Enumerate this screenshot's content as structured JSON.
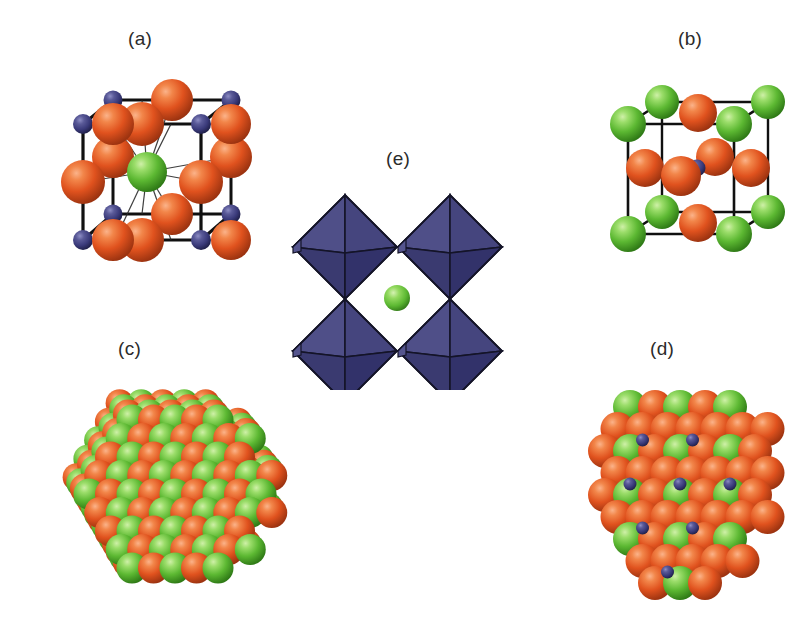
{
  "figure": {
    "background_color": "#ffffff",
    "width": 795,
    "height": 626,
    "caption_font_size": 19,
    "caption_color": "#2b2b2b"
  },
  "palette": {
    "orange_atom": "#E0521E",
    "orange_atom_light": "#F2864A",
    "orange_atom_dark": "#A63512",
    "green_atom": "#5CB832",
    "green_atom_light": "#9BDD6A",
    "green_atom_dark": "#3B8C1C",
    "blue_atom": "#3A3A7A",
    "blue_atom_light": "#6E6EA8",
    "blue_atom_dark": "#22224D",
    "octahedron_face_light": "#4F4F88",
    "octahedron_face_mid": "#43437A",
    "octahedron_face_dark": "#34346A",
    "octahedron_edge": "#141428",
    "cell_edge": "#101010",
    "bond_thin": "#2a2a2a"
  },
  "panels": [
    {
      "id": "a",
      "label": "(a)",
      "label_x": 128,
      "label_y": 28,
      "description": "cubic unit cell with corner small blue atoms, edge-midpoint orange atoms and a central green atom bonded to twelve orange neighbours",
      "structure_type": "unit-cell",
      "atom_counts": {
        "orange": 12,
        "blue": 8,
        "green": 1
      },
      "bonds_from_center": 12
    },
    {
      "id": "b",
      "label": "(b)",
      "label_x": 678,
      "label_y": 28,
      "description": "cubic unit cell with corner green atoms, face-centred orange atoms and one small blue atom at the body centre",
      "structure_type": "unit-cell",
      "atom_counts": {
        "green": 8,
        "orange": 6,
        "blue": 1
      }
    },
    {
      "id": "c",
      "label": "(c)",
      "label_x": 118,
      "label_y": 338,
      "description": "large close-packed cluster of green and orange spheres viewed along a cube diagonal, hexagonal outline",
      "structure_type": "cluster",
      "atom_counts": {
        "green": 61,
        "orange": 44
      }
    },
    {
      "id": "d",
      "label": "(d)",
      "label_x": 650,
      "label_y": 338,
      "description": "flat close-packed slab of alternating green and orange spheres with small blue atoms in interstitial sites",
      "structure_type": "slab",
      "atom_counts": {
        "orange": 33,
        "green": 17,
        "blue": 9
      }
    },
    {
      "id": "e",
      "label": "(e)",
      "label_x": 386,
      "label_y": 148,
      "description": "four corner-sharing blue octahedra surrounding a small green sphere in the central cavity",
      "structure_type": "polyhedral",
      "octahedra_count": 4,
      "central_atom": "green"
    }
  ]
}
